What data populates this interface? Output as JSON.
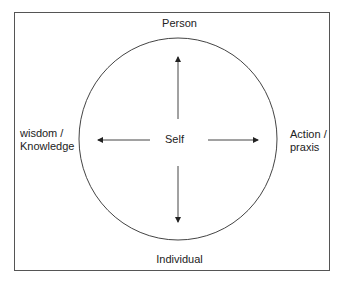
{
  "diagram": {
    "center_label": "Self",
    "top_label": "Person",
    "bottom_label": "Individual",
    "left_label_line1": "wisdom /",
    "left_label_line2": "Knowledge",
    "right_label_line1": "Action /",
    "right_label_line2": "praxis",
    "arrows": [
      "up",
      "down",
      "left",
      "right"
    ]
  }
}
